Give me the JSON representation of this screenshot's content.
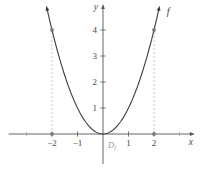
{
  "figure": {
    "background": "#ffffff"
  },
  "chart_data": {
    "type": "line",
    "function": "f(x) = x^2",
    "x_axis_label": "x",
    "y_axis_label": "y",
    "curve_label": "f",
    "domain_label": {
      "main": "D",
      "sub": "f"
    },
    "curve": {
      "expression": "x*x",
      "x_min": -2.2,
      "x_max": 2.2,
      "sample_step": 0.05
    },
    "x_ticks": [
      {
        "value": -2,
        "label": "−2"
      },
      {
        "value": -1,
        "label": "−1"
      },
      {
        "value": 1,
        "label": "1"
      },
      {
        "value": 2,
        "label": "2"
      }
    ],
    "y_ticks": [
      {
        "value": 1,
        "label": "1"
      },
      {
        "value": 2,
        "label": "2"
      },
      {
        "value": 3,
        "label": "3"
      },
      {
        "value": 4,
        "label": "4"
      }
    ],
    "x_minor_ticks": [
      -3,
      3
    ],
    "xlim": [
      -3.7,
      3.6
    ],
    "ylim": [
      -1.15,
      5.0
    ],
    "grid": false,
    "dashed_guides": [
      {
        "x": -2,
        "y_from": 0,
        "y_to": 4
      },
      {
        "x": 2,
        "y_from": 0,
        "y_to": 4
      }
    ],
    "points": [
      {
        "x": -2,
        "y": 0
      },
      {
        "x": 2,
        "y": 0
      },
      {
        "x": -2,
        "y": 4
      },
      {
        "x": 2,
        "y": 4
      }
    ],
    "colors": {
      "curve": "#3c3c3c",
      "axis": "#565656",
      "tick_label": "#464646",
      "minor_tick": "#a0a0a0",
      "dashed_guide": "#b8b8b8",
      "point": "#7a7a7a",
      "domain_label": "#9a9a9a",
      "background": "#ffffff"
    }
  }
}
